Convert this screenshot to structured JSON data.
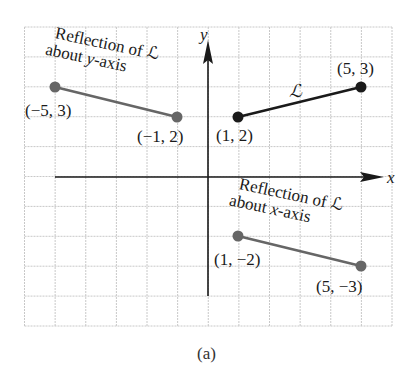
{
  "figure": {
    "caption": "(a)",
    "axes": {
      "x_label": "x",
      "y_label": "y",
      "x_range": [
        -6,
        6
      ],
      "y_range": [
        -5,
        5
      ],
      "grid": true
    },
    "colors": {
      "original": "#1a1a1a",
      "reflection": "#666666",
      "grid": "#c8c8c8",
      "axis": "#1a1a1a"
    },
    "segments": [
      {
        "id": "original",
        "label": "ℒ",
        "start": {
          "x": 1,
          "y": 2,
          "label": "(1, 2)"
        },
        "end": {
          "x": 5,
          "y": 3,
          "label": "(5, 3)"
        }
      },
      {
        "id": "reflection-y",
        "label_line1": "Reflection of ℒ",
        "label_line2_prefix": "about ",
        "label_line2_var": "y",
        "label_line2_suffix": "-axis",
        "start": {
          "x": -5,
          "y": 3,
          "label": "(−5, 3)"
        },
        "end": {
          "x": -1,
          "y": 2,
          "label": "(−1, 2)"
        }
      },
      {
        "id": "reflection-x",
        "label_line1": "Reflection of ℒ",
        "label_line2_prefix": "about ",
        "label_line2_var": "x",
        "label_line2_suffix": "-axis",
        "start": {
          "x": 1,
          "y": -2,
          "label": "(1, −2)"
        },
        "end": {
          "x": 5,
          "y": -3,
          "label": "(5, −3)"
        }
      }
    ]
  }
}
